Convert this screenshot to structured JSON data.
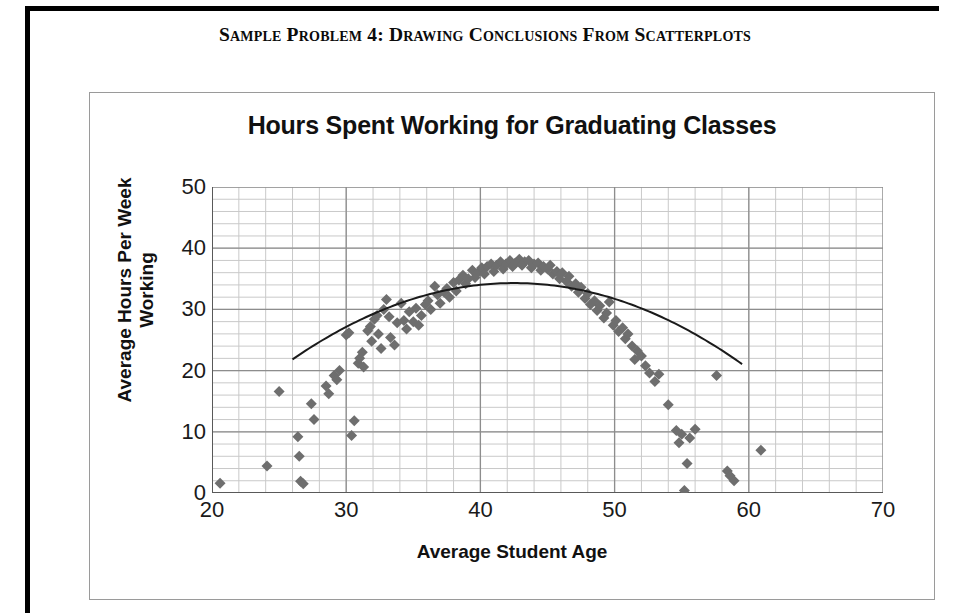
{
  "page": {
    "header_text": "Sample Problem 4:  Drawing Conclusions From Scatterplots"
  },
  "chart_data": {
    "type": "scatter",
    "title": "Hours Spent Working for Graduating Classes",
    "xlabel": "Average Student Age",
    "ylabel": "Average Hours Per Week Working",
    "xlim": [
      20,
      70
    ],
    "ylim": [
      0,
      50
    ],
    "x_ticks": [
      20,
      30,
      40,
      50,
      60,
      70
    ],
    "y_ticks": [
      0,
      10,
      20,
      30,
      40,
      50
    ],
    "x_minor_step": 2,
    "y_minor_step": 2,
    "grid": true,
    "legend": "none",
    "marker": {
      "shape": "diamond",
      "color": "#6e6e6e",
      "size": 11
    },
    "trendline": {
      "type": "quadratic-fit",
      "color": "#1a1a1a",
      "x_start": 26.0,
      "x_end": 59.5,
      "vertex_x": 42.5,
      "vertex_y": 34.3,
      "curvature": -0.0458
    },
    "points": [
      [
        20.6,
        1.6
      ],
      [
        24.1,
        4.4
      ],
      [
        25.0,
        16.6
      ],
      [
        26.4,
        9.2
      ],
      [
        26.5,
        6.0
      ],
      [
        26.6,
        1.9
      ],
      [
        26.8,
        1.5
      ],
      [
        27.4,
        14.6
      ],
      [
        27.6,
        12.0
      ],
      [
        28.5,
        17.5
      ],
      [
        28.7,
        16.2
      ],
      [
        29.1,
        19.2
      ],
      [
        29.3,
        18.5
      ],
      [
        29.5,
        20.0
      ],
      [
        30.0,
        25.8
      ],
      [
        30.2,
        26.2
      ],
      [
        30.4,
        9.4
      ],
      [
        30.6,
        11.8
      ],
      [
        30.9,
        21.2
      ],
      [
        31.0,
        22.0
      ],
      [
        31.2,
        23.0
      ],
      [
        31.3,
        20.6
      ],
      [
        31.6,
        26.5
      ],
      [
        31.8,
        27.2
      ],
      [
        31.9,
        24.8
      ],
      [
        32.1,
        28.4
      ],
      [
        32.3,
        29.0
      ],
      [
        32.4,
        26.0
      ],
      [
        32.6,
        23.6
      ],
      [
        32.8,
        30.0
      ],
      [
        33.0,
        31.6
      ],
      [
        33.2,
        28.8
      ],
      [
        33.3,
        25.4
      ],
      [
        33.6,
        24.2
      ],
      [
        33.8,
        27.8
      ],
      [
        34.1,
        31.0
      ],
      [
        34.3,
        28.2
      ],
      [
        34.5,
        26.8
      ],
      [
        34.7,
        29.6
      ],
      [
        35.0,
        28.0
      ],
      [
        35.2,
        30.2
      ],
      [
        35.4,
        27.4
      ],
      [
        35.6,
        29.0
      ],
      [
        35.9,
        30.8
      ],
      [
        36.1,
        31.4
      ],
      [
        36.3,
        30.0
      ],
      [
        36.6,
        33.8
      ],
      [
        36.8,
        32.4
      ],
      [
        37.0,
        31.0
      ],
      [
        37.3,
        32.8
      ],
      [
        37.5,
        33.4
      ],
      [
        37.7,
        32.0
      ],
      [
        38.0,
        34.4
      ],
      [
        38.2,
        33.0
      ],
      [
        38.4,
        34.8
      ],
      [
        38.7,
        35.6
      ],
      [
        38.9,
        34.2
      ],
      [
        39.1,
        35.0
      ],
      [
        39.4,
        36.4
      ],
      [
        39.6,
        35.2
      ],
      [
        39.8,
        36.0
      ],
      [
        40.1,
        36.8
      ],
      [
        40.3,
        35.8
      ],
      [
        40.5,
        37.0
      ],
      [
        40.8,
        37.4
      ],
      [
        41.0,
        36.2
      ],
      [
        41.2,
        37.2
      ],
      [
        41.5,
        37.8
      ],
      [
        41.7,
        36.6
      ],
      [
        41.9,
        37.4
      ],
      [
        42.2,
        38.0
      ],
      [
        42.4,
        37.0
      ],
      [
        42.6,
        37.6
      ],
      [
        42.9,
        38.2
      ],
      [
        43.1,
        37.2
      ],
      [
        43.3,
        37.8
      ],
      [
        43.6,
        38.0
      ],
      [
        43.8,
        36.8
      ],
      [
        44.0,
        37.4
      ],
      [
        44.3,
        37.6
      ],
      [
        44.5,
        36.4
      ],
      [
        44.7,
        37.0
      ],
      [
        45.0,
        36.6
      ],
      [
        45.2,
        37.2
      ],
      [
        45.4,
        35.8
      ],
      [
        45.7,
        36.2
      ],
      [
        45.9,
        35.0
      ],
      [
        46.1,
        36.0
      ],
      [
        46.4,
        34.6
      ],
      [
        46.6,
        35.4
      ],
      [
        46.8,
        33.8
      ],
      [
        47.1,
        34.2
      ],
      [
        47.3,
        32.8
      ],
      [
        47.5,
        33.6
      ],
      [
        47.8,
        31.8
      ],
      [
        48.0,
        32.6
      ],
      [
        48.2,
        30.8
      ],
      [
        48.5,
        31.4
      ],
      [
        48.7,
        29.8
      ],
      [
        48.9,
        30.6
      ],
      [
        49.2,
        28.6
      ],
      [
        49.4,
        29.4
      ],
      [
        49.6,
        31.2
      ],
      [
        49.9,
        27.4
      ],
      [
        50.1,
        28.2
      ],
      [
        50.3,
        26.4
      ],
      [
        50.6,
        27.0
      ],
      [
        50.8,
        25.2
      ],
      [
        51.0,
        26.0
      ],
      [
        51.3,
        24.0
      ],
      [
        51.5,
        21.8
      ],
      [
        51.7,
        23.2
      ],
      [
        52.0,
        22.4
      ],
      [
        52.3,
        20.8
      ],
      [
        52.6,
        19.6
      ],
      [
        53.0,
        18.2
      ],
      [
        53.3,
        19.4
      ],
      [
        54.0,
        14.4
      ],
      [
        54.6,
        10.2
      ],
      [
        54.8,
        8.2
      ],
      [
        55.0,
        9.6
      ],
      [
        55.2,
        0.4
      ],
      [
        55.4,
        4.8
      ],
      [
        55.6,
        9.0
      ],
      [
        56.0,
        10.4
      ],
      [
        57.6,
        19.2
      ],
      [
        58.4,
        3.6
      ],
      [
        58.6,
        2.8
      ],
      [
        58.9,
        2.0
      ],
      [
        60.9,
        7.0
      ]
    ]
  }
}
